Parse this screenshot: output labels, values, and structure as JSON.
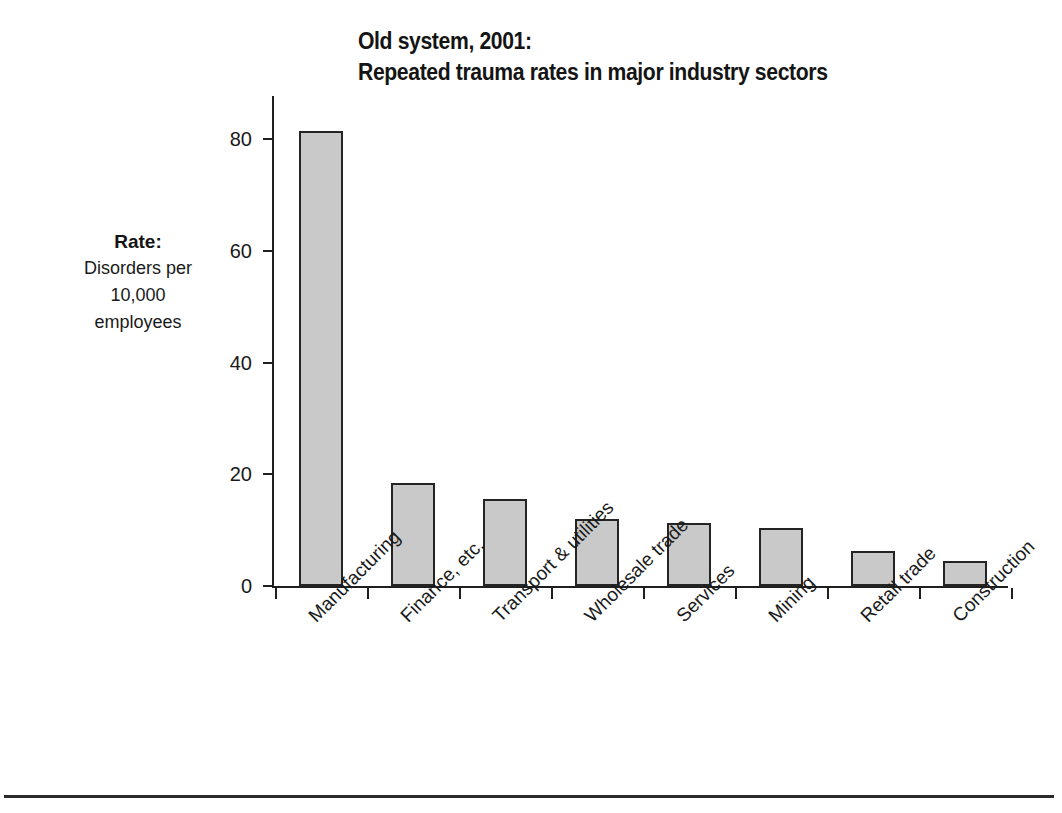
{
  "chart_data": {
    "type": "bar",
    "title": "Old system, 2001: Repeated trauma rates in major industry sectors",
    "title_lines": [
      "Old system, 2001:",
      "Repeated trauma rates in major industry sectors"
    ],
    "xlabel": "",
    "ylabel": "Rate: Disorders per 10,000 employees",
    "ylabel_lines": [
      "Rate:",
      "Disorders per",
      "10,000",
      "employees"
    ],
    "categories": [
      "Manufacturing",
      "Finance, etc.",
      "Transport & utilities",
      "Wholesale trade",
      "Services",
      "Mining",
      "Retail trade",
      "Construction"
    ],
    "values": [
      81.5,
      18.5,
      15.5,
      12.0,
      11.2,
      10.3,
      6.2,
      4.5
    ],
    "ylim": [
      0,
      87
    ],
    "yticks": [
      0,
      20,
      40,
      60,
      80
    ],
    "ytick_labels": [
      "0",
      "20",
      "40",
      "60",
      "80"
    ],
    "grid": false,
    "legend": null,
    "bar_fill": "#c9c9c9",
    "bar_edge": "#242424",
    "axis_color": "#1f1f1f",
    "background": "#ffffff",
    "category_label_rotation": -45
  }
}
